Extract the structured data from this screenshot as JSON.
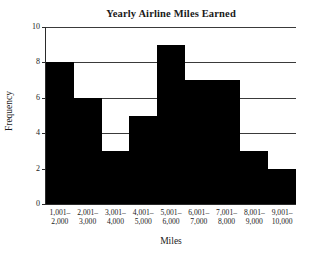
{
  "chart_data": {
    "type": "bar",
    "title": "Yearly Airline Miles Earned",
    "xlabel": "Miles",
    "ylabel": "Frequency",
    "categories": [
      "1,001–2,000",
      "2,001–3,000",
      "3,001–4,000",
      "4,001–5,000",
      "5,001–6,000",
      "6,001–7,000",
      "7,001–8,000",
      "8,001–9,000",
      "9,001–10,000"
    ],
    "category_lines": [
      {
        "top": "1,001–",
        "bottom": "2,000"
      },
      {
        "top": "2,001–",
        "bottom": "3,000"
      },
      {
        "top": "3,001–",
        "bottom": "4,000"
      },
      {
        "top": "4,001–",
        "bottom": "5,000"
      },
      {
        "top": "5,001–",
        "bottom": "6,000"
      },
      {
        "top": "6,001–",
        "bottom": "7,000"
      },
      {
        "top": "7,001–",
        "bottom": "8,000"
      },
      {
        "top": "8,001–",
        "bottom": "9,000"
      },
      {
        "top": "9,001–",
        "bottom": "10,000"
      }
    ],
    "values": [
      8,
      6,
      3,
      5,
      9,
      7,
      7,
      3,
      2
    ],
    "ylim": [
      0,
      10
    ],
    "yticks": [
      0,
      2,
      4,
      6,
      8,
      10
    ],
    "ytick_labels": [
      "0",
      "2",
      "4",
      "6",
      "8",
      "10"
    ],
    "grid": "horizontal",
    "gridline_values": [
      2,
      4,
      6,
      8,
      10
    ],
    "legend": null,
    "bar_color": "#000000",
    "gridline_color": "#3a3a3a",
    "axis_color": "#2b2b2b",
    "background_color": "#ffffff"
  }
}
